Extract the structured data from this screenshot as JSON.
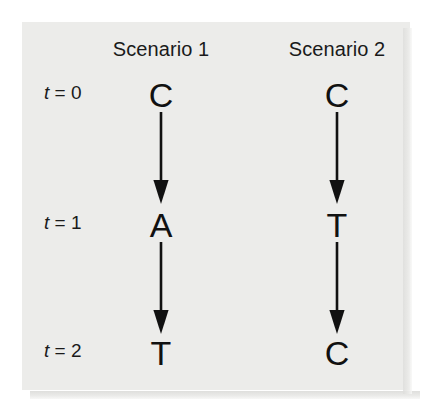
{
  "figure": {
    "background_color": "#ffffff",
    "panel_color": "#ececea",
    "ink_color": "#111111",
    "columns": [
      {
        "header": "Scenario 1"
      },
      {
        "header": "Scenario 2"
      }
    ],
    "row_labels": [
      {
        "variable": "t",
        "relation": "= 0"
      },
      {
        "variable": "t",
        "relation": "= 1"
      },
      {
        "variable": "t",
        "relation": "= 2"
      }
    ],
    "cells": {
      "scenario1": {
        "t0": "C",
        "t1": "A",
        "t2": "T"
      },
      "scenario2": {
        "t0": "C",
        "t1": "T",
        "t2": "C"
      }
    },
    "arrows": {
      "icon": "arrow-down-icon",
      "direction": "down",
      "count": 4
    }
  }
}
